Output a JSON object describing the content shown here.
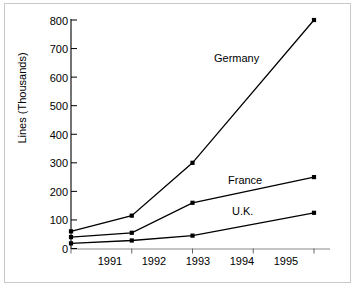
{
  "chart_data": {
    "type": "line",
    "title": "",
    "subtitle": "",
    "xlabel": "",
    "ylabel": "Lines (Thousands)",
    "x": [
      1991,
      1992,
      1993,
      1994,
      1995
    ],
    "categories": [
      "1991",
      "1992",
      "1993",
      "1994",
      "1995"
    ],
    "xtick_labels": [
      "1991",
      "1992",
      "1993",
      "1994",
      "1995"
    ],
    "ytick_labels": [
      "0",
      "100",
      "200",
      "300",
      "400",
      "500",
      "600",
      "700",
      "800"
    ],
    "ytick_values": [
      0,
      100,
      200,
      300,
      400,
      500,
      600,
      700,
      800
    ],
    "ylim": [
      0,
      800
    ],
    "xlim": [
      1991,
      1995
    ],
    "grid": false,
    "legend_position": "inline-annotations",
    "markers": "filled-square",
    "line_color": "#000000",
    "marker_color": "#000000",
    "series": [
      {
        "name": "Germany",
        "label": "Germany",
        "values": [
          60,
          115,
          300,
          null,
          800
        ],
        "points": [
          {
            "x": 1991,
            "y": 60
          },
          {
            "x": 1992,
            "y": 115
          },
          {
            "x": 1993,
            "y": 300
          },
          {
            "x": 1995,
            "y": 800
          }
        ]
      },
      {
        "name": "France",
        "label": "France",
        "values": [
          40,
          55,
          160,
          null,
          250
        ],
        "points": [
          {
            "x": 1991,
            "y": 40
          },
          {
            "x": 1992,
            "y": 55
          },
          {
            "x": 1993,
            "y": 160
          },
          {
            "x": 1995,
            "y": 250
          }
        ]
      },
      {
        "name": "U.K.",
        "label": "U.K.",
        "values": [
          18,
          28,
          45,
          null,
          125
        ],
        "points": [
          {
            "x": 1991,
            "y": 18
          },
          {
            "x": 1992,
            "y": 28
          },
          {
            "x": 1993,
            "y": 45
          },
          {
            "x": 1995,
            "y": 125
          }
        ]
      }
    ],
    "annotations": [
      {
        "text": "Germany",
        "x_px": 214,
        "y_px": 58
      },
      {
        "text": "France",
        "x_px": 228,
        "y_px": 180
      },
      {
        "text": "U.K.",
        "x_px": 232,
        "y_px": 211
      }
    ]
  },
  "axis": {
    "y_label": "Lines (Thousands)",
    "y_ticks": [
      "800",
      "700",
      "600",
      "500",
      "400",
      "300",
      "200",
      "100",
      "0"
    ],
    "x_ticks": [
      "1991",
      "1992",
      "1993",
      "1994",
      "1995"
    ]
  },
  "series_labels": {
    "germany": "Germany",
    "france": "France",
    "uk": "U.K."
  }
}
